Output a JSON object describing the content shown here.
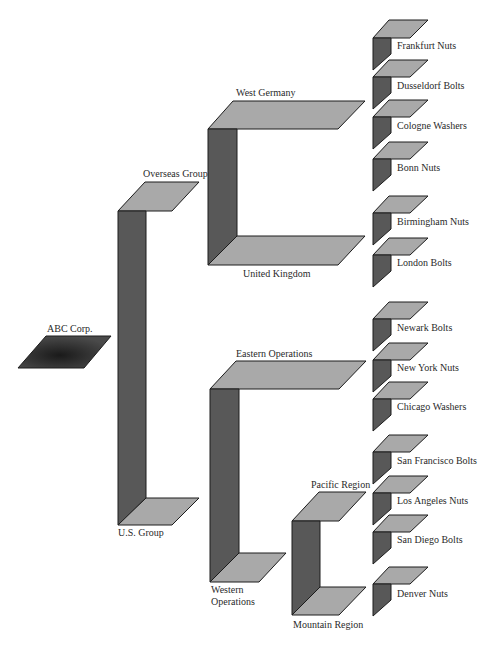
{
  "colors": {
    "top_face": "#a9a9a9",
    "side_face": "#585858",
    "root_face": "#3a3a3a",
    "edge": "#1c1c1c",
    "text": "#2a2a2a",
    "background": "#ffffff"
  },
  "root": {
    "label": "ABC Corp."
  },
  "groups": [
    {
      "label": "Overseas Group"
    },
    {
      "label": "U.S. Group"
    }
  ],
  "divisions": [
    {
      "label": "West Germany",
      "group": "Overseas Group"
    },
    {
      "label": "United Kingdom",
      "group": "Overseas Group"
    },
    {
      "label": "Eastern Operations",
      "group": "U.S. Group"
    },
    {
      "label": "Western Operations",
      "group": "U.S. Group"
    }
  ],
  "regions": [
    {
      "label": "Pacific Region",
      "division": "Western Operations"
    },
    {
      "label": "Mountain Region",
      "division": "Western Operations"
    }
  ],
  "units": [
    {
      "label": "Frankfurt Nuts",
      "parent": "West Germany"
    },
    {
      "label": "Dusseldorf Bolts",
      "parent": "West Germany"
    },
    {
      "label": "Cologne Washers",
      "parent": "West Germany"
    },
    {
      "label": "Bonn Nuts",
      "parent": "West Germany"
    },
    {
      "label": "Birmingham Nuts",
      "parent": "United Kingdom"
    },
    {
      "label": "London Bolts",
      "parent": "United Kingdom"
    },
    {
      "label": "Newark Bolts",
      "parent": "Eastern Operations"
    },
    {
      "label": "New York Nuts",
      "parent": "Eastern Operations"
    },
    {
      "label": "Chicago Washers",
      "parent": "Eastern Operations"
    },
    {
      "label": "San Francisco Bolts",
      "parent": "Pacific Region"
    },
    {
      "label": "Los Angeles Nuts",
      "parent": "Pacific Region"
    },
    {
      "label": "San Diego Bolts",
      "parent": "Pacific Region"
    },
    {
      "label": "Denver Nuts",
      "parent": "Mountain Region"
    }
  ]
}
